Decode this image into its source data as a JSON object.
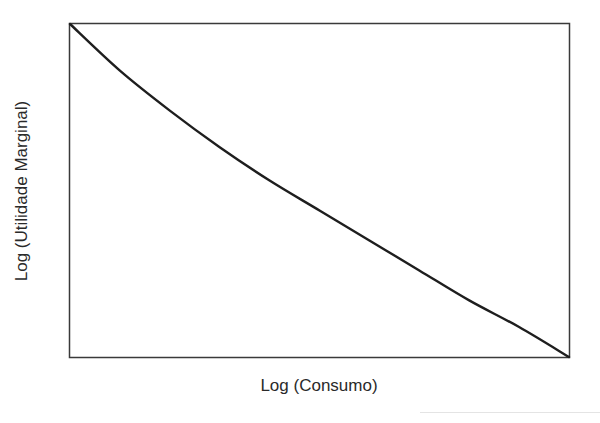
{
  "chart_data": {
    "type": "line",
    "title": "",
    "xlabel": "Log (Consumo)",
    "ylabel": "Log (Utilidade Marginal)",
    "grid": false,
    "legend": null,
    "x_ticks": [],
    "y_ticks": [],
    "series": [
      {
        "name": "Utilidade Marginal",
        "description": "Convex decreasing curve from top-left corner to bottom-right corner",
        "x": [
          0,
          0.1,
          0.2,
          0.3,
          0.4,
          0.5,
          0.6,
          0.7,
          0.8,
          0.9,
          1.0
        ],
        "y": [
          1.0,
          0.86,
          0.74,
          0.63,
          0.53,
          0.44,
          0.35,
          0.26,
          0.17,
          0.09,
          0.0
        ]
      }
    ],
    "xlim": [
      0,
      1
    ],
    "ylim": [
      0,
      1
    ]
  },
  "colors": {
    "line": "#1e1e1e",
    "frame": "#3a3a3a",
    "text": "#2a2a2a"
  }
}
